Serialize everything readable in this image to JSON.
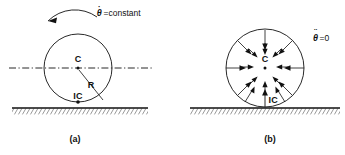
{
  "figure": {
    "background_color": "#ffffff",
    "line_color": "#111111",
    "panels": [
      {
        "id": "a",
        "caption": "(a)",
        "condition_label": "=constant",
        "condition_symbol": "θ",
        "condition_dots": 1,
        "condition_full": "θ̇ = constant",
        "center_label": "C",
        "contact_label": "IC",
        "radius_label": "R",
        "rotation_arrow": "counterclockwise-curved-arrow",
        "has_centerline": true,
        "has_ground": true,
        "circle": {
          "cx": 78,
          "cy": 68,
          "r": 34
        },
        "centerline": {
          "x1": 9,
          "x2": 152,
          "y": 68
        },
        "ground": {
          "x1": 12,
          "x2": 148,
          "y": 108
        }
      },
      {
        "id": "b",
        "caption": "(b)",
        "condition_label": "=0",
        "condition_symbol": "θ",
        "condition_dots": 2,
        "condition_full": "θ̈ = 0",
        "center_label": "C",
        "contact_label": "IC",
        "radius_label": "",
        "acceleration_arrows": "radial-inward-toward-center",
        "acceleration_arrow_count": 20,
        "contact_arrow": "upward-arrow-at-IC",
        "has_centerline": false,
        "has_ground": true,
        "circle": {
          "cx": 265,
          "cy": 68,
          "r": 39
        },
        "ground": {
          "x1": 190,
          "x2": 340,
          "y": 108
        }
      }
    ]
  }
}
